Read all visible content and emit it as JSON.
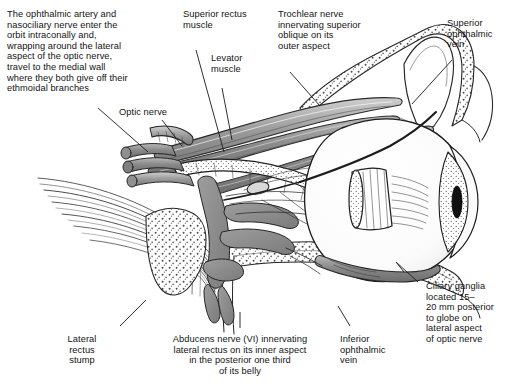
{
  "figure": {
    "type": "anatomical-line-drawing",
    "background_color": "#ffffff",
    "ink_color": "#1a1a1a"
  },
  "annotations": [
    {
      "id": "ophthalmic-artery-note",
      "text": "The ophthalmic artery and\nnasociliary nerve enter the\norbit intraconally and,\nwrapping around the lateral\naspect of the optic nerve,\ntravel to the medial wall\nwhere they both give off their\nethmoidal branches",
      "align": "left"
    },
    {
      "id": "superior-rectus-muscle",
      "text": "Superior rectus\nmuscle",
      "align": "left"
    },
    {
      "id": "levator-muscle",
      "text": "Levator\nmuscle",
      "align": "left"
    },
    {
      "id": "trochlear-nerve",
      "text": "Trochlear nerve\ninnervating superior\noblique on its\nouter aspect",
      "align": "left"
    },
    {
      "id": "superior-ophthalmic-vein",
      "text": "Superior\nophthalmic\nvein",
      "align": "left"
    },
    {
      "id": "optic-nerve",
      "text": "Optic nerve",
      "align": "left"
    },
    {
      "id": "ciliary-ganglia",
      "text": "Ciliary ganglia\nlocated 15–\n20 mm posterior\nto globe on\nlateral aspect\nof optic nerve",
      "align": "left"
    },
    {
      "id": "inferior-ophthalmic-vein",
      "text": "Inferior\nophthalmic\nvein",
      "align": "left"
    },
    {
      "id": "abducens-nerve",
      "text": "Abducens nerve (VI) innervating\nlateral rectus on its inner aspect\nin the posterior one third\nof its belly",
      "align": "center"
    },
    {
      "id": "lateral-rectus-stump",
      "text": "Lateral\nrectus\nstump",
      "align": "center"
    }
  ]
}
